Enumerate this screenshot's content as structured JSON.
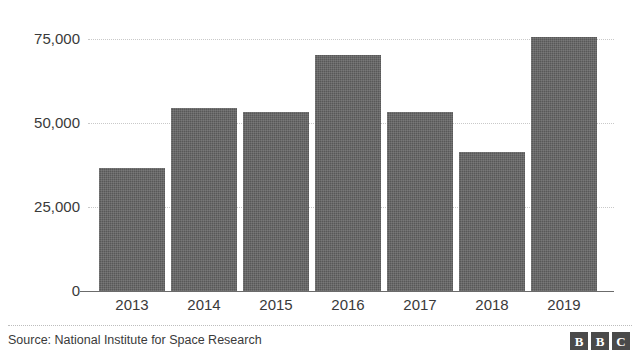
{
  "chart_data": {
    "type": "bar",
    "title": "",
    "title_remnant": "",
    "xlabel": "",
    "ylabel": "",
    "categories": [
      "2013",
      "2014",
      "2015",
      "2016",
      "2017",
      "2018",
      "2019"
    ],
    "values": [
      36600,
      54500,
      53300,
      70200,
      53300,
      41400,
      75600
    ],
    "ylim": [
      0,
      75000
    ],
    "yticks": [
      0,
      25000,
      50000,
      75000
    ],
    "ytick_labels": [
      "0",
      "25,000",
      "50,000",
      "75,000"
    ],
    "grid": true,
    "legend": null,
    "bar_color": "#585858",
    "grid_color": "#c9c9c9",
    "axis_color": "#6b6b6b"
  },
  "footer": {
    "source": "Source: National Institute for Space Research",
    "logo": [
      "B",
      "B",
      "C"
    ]
  }
}
